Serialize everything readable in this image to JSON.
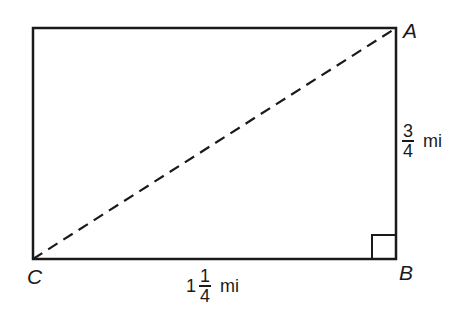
{
  "figure": {
    "type": "rectangle-with-diagonal",
    "stroke_color": "#1a1a1a",
    "rectangle": {
      "x": 33,
      "y": 28,
      "width": 363,
      "height": 231
    },
    "diagonal": {
      "from": "C",
      "to": "A",
      "style": "dashed"
    },
    "right_angle_at": "B"
  },
  "vertices": {
    "A": {
      "label": "A"
    },
    "B": {
      "label": "B"
    },
    "C": {
      "label": "C"
    }
  },
  "measurements": {
    "vertical_side": {
      "side": "AB",
      "whole": "",
      "numerator": "3",
      "denominator": "4",
      "unit": "mi"
    },
    "horizontal_side": {
      "side": "CB",
      "whole": "1",
      "numerator": "1",
      "denominator": "4",
      "unit": "mi"
    }
  }
}
